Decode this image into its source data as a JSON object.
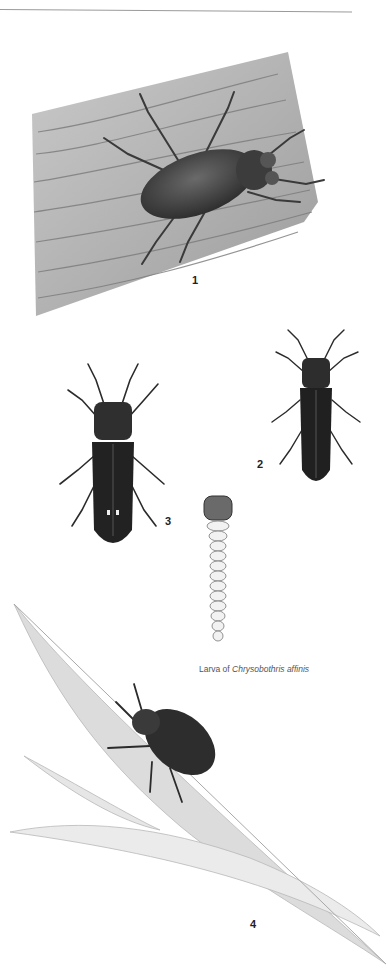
{
  "page": {
    "type": "field-guide illustration plate",
    "background": "#ffffff"
  },
  "figures": [
    {
      "id": 1,
      "label": "1",
      "subject": "beetle on bark",
      "description": "Elongate metallic wood-boring beetle resting on a slab of weathered wood"
    },
    {
      "id": 2,
      "label": "2",
      "subject": "slender beetle",
      "description": "Narrow dark beetle, dorsal view"
    },
    {
      "id": 3,
      "label": "3",
      "subject": "slender beetle with spots",
      "description": "Dark elongate beetle with two small pale spots near elytral tips, dorsal view"
    },
    {
      "id": "larva",
      "label": "",
      "subject": "flat-headed borer larva",
      "description": "Segmented pale larva with broad flattened thoracic segment"
    },
    {
      "id": 4,
      "label": "4",
      "subject": "beetle on leaf",
      "description": "Oval dark beetle on a long serrated leaf"
    }
  ],
  "caption": {
    "prefix": "Larva of ",
    "species": "Chrysobothris affinis"
  }
}
